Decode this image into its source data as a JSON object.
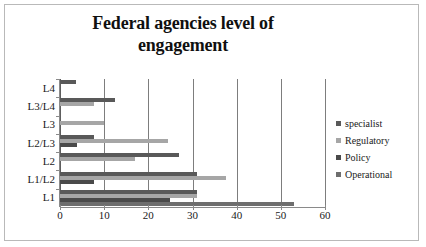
{
  "chart_data": {
    "type": "bar",
    "orientation": "horizontal",
    "title": "Federal agencies level of engagement",
    "title_line1": "Federal agencies level of",
    "title_line2": "engagement",
    "xlabel": "",
    "ylabel": "",
    "xlim": [
      0,
      60
    ],
    "xticks": [
      0,
      10,
      20,
      30,
      40,
      50,
      60
    ],
    "xtick_labels": [
      "0",
      "10",
      "20",
      "30",
      "40",
      "50",
      "60"
    ],
    "grid": "vertical",
    "legend_position": "right",
    "categories": [
      "L1",
      "L1/L2",
      "L2",
      "L2/L3",
      "L3",
      "L3/L4",
      "L4"
    ],
    "series": [
      {
        "name": "specialist",
        "color": "#595959",
        "values": [
          31,
          31,
          27,
          7.8,
          0,
          12.5,
          3.7
        ]
      },
      {
        "name": "Regulatory",
        "color": "#a6a6a6",
        "values": [
          31,
          37.5,
          17,
          24.5,
          10,
          7.8,
          0
        ]
      },
      {
        "name": "Policy",
        "color": "#4a4a4a",
        "values": [
          25,
          7.8,
          0,
          3.8,
          0,
          0,
          0
        ]
      },
      {
        "name": "Operational",
        "color": "#6e6e6e",
        "values": [
          53,
          0,
          0,
          0,
          0,
          0,
          0
        ]
      }
    ]
  },
  "legend": {
    "items": [
      {
        "label": "specialist",
        "color": "#595959"
      },
      {
        "label": "Regulatory",
        "color": "#a6a6a6"
      },
      {
        "label": "Policy",
        "color": "#4a4a4a"
      },
      {
        "label": "Operational",
        "color": "#6e6e6e"
      }
    ]
  },
  "colors": {
    "background": "#ffffff",
    "border": "#b9b9b9",
    "gridline": "#7d7d7d",
    "axis": "#8a8a8a",
    "text": "#1a1a1a"
  }
}
